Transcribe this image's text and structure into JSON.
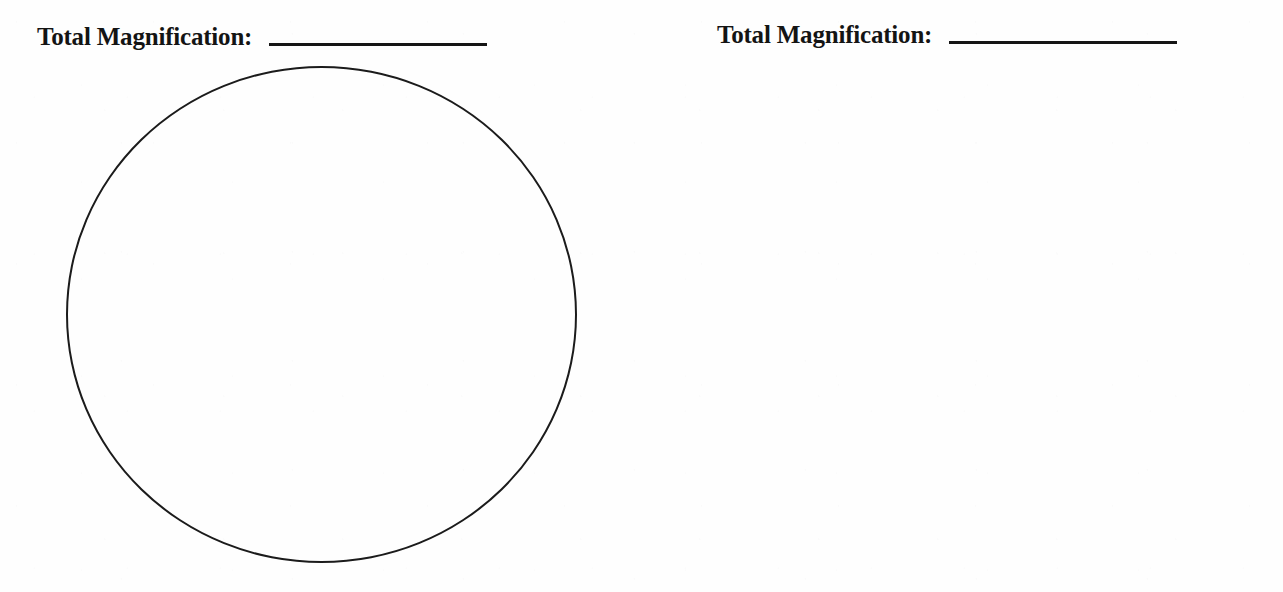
{
  "page": {
    "background_color": "#fefefe",
    "ink_color": "#151515",
    "panel_count": 2
  },
  "panels": [
    {
      "id": "left",
      "label": "Total Magnification:",
      "answer_value": "",
      "answer_placeholder": "",
      "circle": {
        "name": "field-of-view-circle",
        "filled": false,
        "stroke_color": "#1b1b1b"
      }
    },
    {
      "id": "right",
      "label": "Total Magnification:",
      "answer_value": "",
      "answer_placeholder": "",
      "circle": {
        "name": "field-of-view-circle",
        "filled": false,
        "stroke_color": "#1b1b1b"
      }
    }
  ]
}
